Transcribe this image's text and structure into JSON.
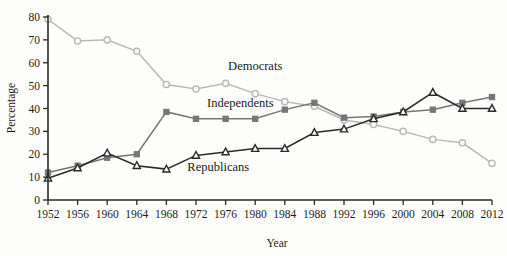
{
  "chart_data": {
    "type": "line",
    "title": "",
    "xlabel": "Year",
    "ylabel": "Percentage",
    "xlim": [
      1952,
      2012
    ],
    "ylim": [
      0,
      80
    ],
    "ytick_step": 10,
    "grid": false,
    "legend_position": "inline-annotations",
    "categories": [
      1952,
      1956,
      1960,
      1964,
      1968,
      1972,
      1976,
      1980,
      1984,
      1988,
      1992,
      1996,
      2000,
      2004,
      2008,
      2012
    ],
    "xticklabels": [
      "1952",
      "1956",
      "1960",
      "1964",
      "1968",
      "1972",
      "1976",
      "1980",
      "1984",
      "1988",
      "1992",
      "1996",
      "2000",
      "2004",
      "2008",
      "2012"
    ],
    "yticklabels": [
      "0",
      "10",
      "20",
      "30",
      "40",
      "50",
      "60",
      "70",
      "80"
    ],
    "series": [
      {
        "name": "Democrats",
        "label": "Democrats",
        "color": "#b9b9b9",
        "marker": "circle-open",
        "label_x": 1980,
        "label_y": 57,
        "values": [
          79,
          69.5,
          70,
          65,
          50.5,
          48.5,
          51,
          46.5,
          43,
          41,
          35,
          33,
          30,
          26.5,
          25,
          16
        ]
      },
      {
        "name": "Independents",
        "label": "Independents",
        "color": "#767676",
        "marker": "square-filled",
        "label_x": 1978,
        "label_y": 40.5,
        "values": [
          12,
          15,
          18.5,
          20,
          38.5,
          35.5,
          35.5,
          35.5,
          39.5,
          42.5,
          36,
          36.5,
          38.5,
          39.5,
          42.5,
          45
        ]
      },
      {
        "name": "Republicans",
        "label": "Republicans",
        "color": "#2b2b2b",
        "marker": "triangle-open",
        "label_x": 1975,
        "label_y": 12.5,
        "values": [
          9.5,
          14,
          20.5,
          15,
          13.5,
          19.5,
          21,
          22.5,
          22.5,
          29.5,
          31,
          35.5,
          38.5,
          47,
          40,
          40
        ]
      }
    ]
  }
}
